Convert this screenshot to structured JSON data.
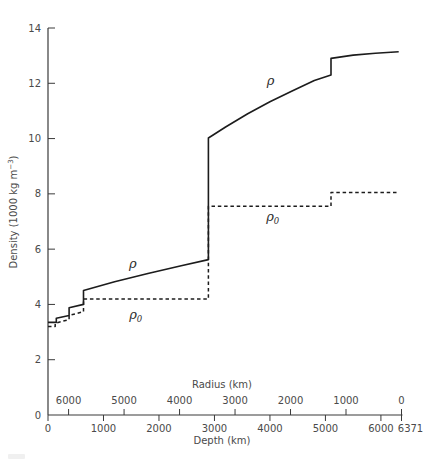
{
  "colors": {
    "background": "#ffffff",
    "curve": "#1c1c1c",
    "axis": "#3a3a3a",
    "text": "#4a4a4a"
  },
  "chart_data": {
    "type": "line",
    "title": "",
    "ylabel": "Density (1000 kg m−3)",
    "ylabel_parts": {
      "before": "Density (1000 kg m",
      "sup": "−3",
      "after": ")"
    },
    "y_axis": {
      "range": [
        0,
        14
      ],
      "ticks": [
        {
          "v": 0,
          "tick": false
        },
        {
          "v": 2
        },
        {
          "v": 4
        },
        {
          "v": 6
        },
        {
          "v": 8
        },
        {
          "v": 10
        },
        {
          "v": 12
        },
        {
          "v": 14
        }
      ]
    },
    "depth_axis": {
      "title": "Depth (km)",
      "range": [
        0,
        6371
      ],
      "ticks": [
        {
          "v": 0
        },
        {
          "v": 1000
        },
        {
          "v": 2000
        },
        {
          "v": 3000
        },
        {
          "v": 4000
        },
        {
          "v": 5000
        },
        {
          "v": 6000
        },
        {
          "v": 6371,
          "label_dx": 9
        }
      ]
    },
    "radius_axis": {
      "title": "Radius (km)",
      "ticks": [
        {
          "v": 6000
        },
        {
          "v": 5000
        },
        {
          "v": 4000
        },
        {
          "v": 3000
        },
        {
          "v": 2000
        },
        {
          "v": 1000
        },
        {
          "v": 0
        }
      ]
    },
    "series": [
      {
        "name": "rho",
        "label": "ρ",
        "style": "solid",
        "points_depth_density": [
          [
            0,
            3.35
          ],
          [
            150,
            3.35
          ],
          [
            150,
            3.5
          ],
          [
            380,
            3.6
          ],
          [
            380,
            3.88
          ],
          [
            640,
            4.0
          ],
          [
            640,
            4.5
          ],
          [
            1200,
            4.82
          ],
          [
            1800,
            5.12
          ],
          [
            2400,
            5.4
          ],
          [
            2890,
            5.62
          ],
          [
            2890,
            10.02
          ],
          [
            3200,
            10.42
          ],
          [
            3600,
            10.9
          ],
          [
            4000,
            11.33
          ],
          [
            4400,
            11.72
          ],
          [
            4800,
            12.1
          ],
          [
            5100,
            12.3
          ],
          [
            5100,
            12.9
          ],
          [
            5500,
            13.02
          ],
          [
            5900,
            13.09
          ],
          [
            6320,
            13.14
          ]
        ]
      },
      {
        "name": "rho0",
        "label": "ρ0",
        "style": "dashed",
        "points_depth_density": [
          [
            0,
            3.2
          ],
          [
            130,
            3.2
          ],
          [
            130,
            3.32
          ],
          [
            380,
            3.45
          ],
          [
            380,
            3.6
          ],
          [
            640,
            3.74
          ],
          [
            640,
            4.2
          ],
          [
            2890,
            4.2
          ],
          [
            2890,
            7.55
          ],
          [
            5100,
            7.55
          ],
          [
            5100,
            8.05
          ],
          [
            6320,
            8.05
          ]
        ]
      }
    ],
    "annotations": [
      {
        "id": "rho-mantle",
        "main": "ρ",
        "sub": "",
        "depth": 1530,
        "density": 5.45
      },
      {
        "id": "rho-core",
        "main": "ρ",
        "sub": "",
        "depth": 4010,
        "density": 12.08
      },
      {
        "id": "rho0-mantle",
        "main": "ρ",
        "sub": "0",
        "depth": 1580,
        "density": 3.6
      },
      {
        "id": "rho0-core",
        "main": "ρ",
        "sub": "0",
        "depth": 4050,
        "density": 7.15
      }
    ]
  }
}
